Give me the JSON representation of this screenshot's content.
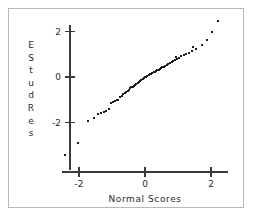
{
  "chart_data": {
    "type": "scatter",
    "title": "",
    "subtitle": "",
    "xlabel": "Normal Scores",
    "ylabel": "EStudRes",
    "ylabel_chars": [
      "E",
      "S",
      "t",
      "u",
      "d",
      "R",
      "e",
      "s"
    ],
    "xlim": [
      -2.6,
      2.5
    ],
    "ylim": [
      -3.6,
      2.7
    ],
    "xticks": [
      -2,
      0,
      2
    ],
    "xticklabels": [
      "-2",
      "0",
      "2"
    ],
    "yticks": [
      -2,
      0,
      2
    ],
    "yticklabels": [
      "-2",
      "0",
      "2"
    ],
    "grid": false,
    "legend": null,
    "marker": "square",
    "marker_color": "#1b1b1b",
    "marker_size": 2,
    "n_points": 70,
    "x": [
      -2.41,
      -2.02,
      -1.72,
      -1.55,
      -1.42,
      -1.33,
      -1.24,
      -1.17,
      -1.1,
      -1.03,
      -0.97,
      -0.91,
      -0.86,
      -0.81,
      -0.76,
      -0.71,
      -0.66,
      -0.62,
      -0.57,
      -0.53,
      -0.49,
      -0.45,
      -0.41,
      -0.37,
      -0.33,
      -0.29,
      -0.26,
      -0.22,
      -0.18,
      -0.15,
      -0.11,
      -0.07,
      -0.04,
      0.0,
      0.04,
      0.07,
      0.11,
      0.15,
      0.18,
      0.22,
      0.26,
      0.29,
      0.33,
      0.37,
      0.41,
      0.45,
      0.49,
      0.53,
      0.57,
      0.62,
      0.66,
      0.71,
      0.76,
      0.81,
      0.86,
      0.91,
      0.97,
      1.03,
      1.1,
      1.17,
      1.24,
      1.33,
      1.42,
      1.55,
      1.72,
      2.02,
      2.21,
      1.88,
      1.45,
      0.94
    ],
    "y": [
      -3.42,
      -2.88,
      -1.92,
      -1.78,
      -1.62,
      -1.58,
      -1.52,
      -1.48,
      -1.42,
      -1.12,
      -1.09,
      -1.06,
      -1.03,
      -1.0,
      -0.88,
      -0.82,
      -0.76,
      -0.7,
      -0.65,
      -0.6,
      -0.55,
      -0.5,
      -0.46,
      -0.42,
      -0.38,
      -0.34,
      -0.3,
      -0.26,
      -0.22,
      -0.18,
      -0.14,
      -0.1,
      -0.06,
      -0.02,
      0.02,
      0.06,
      0.1,
      0.14,
      0.12,
      0.16,
      0.2,
      0.24,
      0.28,
      0.32,
      0.3,
      0.34,
      0.38,
      0.42,
      0.46,
      0.5,
      0.54,
      0.58,
      0.62,
      0.66,
      0.7,
      0.74,
      0.78,
      0.82,
      0.92,
      0.96,
      1.0,
      1.04,
      1.14,
      1.24,
      1.42,
      1.96,
      2.45,
      1.62,
      1.3,
      0.86
    ],
    "reference_line": false
  },
  "axes": {
    "x_axis_name": "normal-scores-axis",
    "y_axis_name": "estudres-axis"
  },
  "figure": {
    "background_color": "#ffffff",
    "frame_color": "#b8b8b8",
    "axis_color": "#3a3a3a",
    "text_color": "#2b2b2b"
  }
}
